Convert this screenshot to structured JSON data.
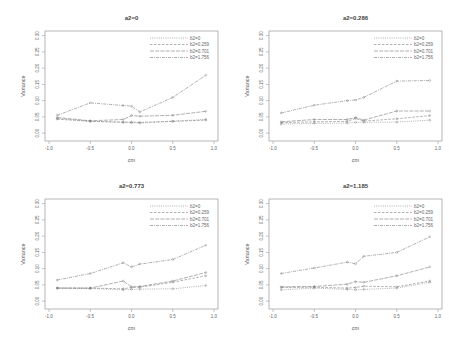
{
  "chart_data": [
    {
      "type": "line",
      "title": "a2=0",
      "xlabel": "cm",
      "ylabel": "Variance",
      "xlim": [
        -1.0,
        1.0
      ],
      "ylim": [
        0.0,
        0.3
      ],
      "xticks": [
        "-1.0",
        "-0.5",
        "0.0",
        "0.5",
        "1.0"
      ],
      "yticks": [
        "0.00",
        "0.05",
        "0.10",
        "0.15",
        "0.20",
        "0.25",
        "0.30"
      ],
      "grid": false,
      "legend_position": "top-right",
      "x": [
        -0.9,
        -0.5,
        -0.1,
        0.0,
        0.1,
        0.5,
        0.9
      ],
      "series": [
        {
          "name": "b2=0",
          "values": [
            0.045,
            0.037,
            0.033,
            0.032,
            0.031,
            0.037,
            0.042
          ]
        },
        {
          "name": "b2=0.259",
          "values": [
            0.043,
            0.036,
            0.034,
            0.034,
            0.033,
            0.036,
            0.04
          ]
        },
        {
          "name": "b2=0.701",
          "values": [
            0.048,
            0.038,
            0.042,
            0.054,
            0.052,
            0.055,
            0.067
          ]
        },
        {
          "name": "b2=1.756",
          "values": [
            0.055,
            0.093,
            0.085,
            0.083,
            0.065,
            0.11,
            0.178
          ]
        }
      ]
    },
    {
      "type": "line",
      "title": "a2=0.286",
      "xlabel": "cm",
      "ylabel": "Variance",
      "xlim": [
        -1.0,
        1.0
      ],
      "ylim": [
        0.0,
        0.3
      ],
      "xticks": [
        "-1.0",
        "-0.5",
        "0.0",
        "0.5",
        "1.0"
      ],
      "yticks": [
        "0.00",
        "0.05",
        "0.10",
        "0.15",
        "0.20",
        "0.25",
        "0.30"
      ],
      "grid": false,
      "legend_position": "top-right",
      "x": [
        -0.9,
        -0.5,
        -0.1,
        0.0,
        0.1,
        0.5,
        0.9
      ],
      "series": [
        {
          "name": "b2=0",
          "values": [
            0.028,
            0.03,
            0.031,
            0.033,
            0.033,
            0.034,
            0.04
          ]
        },
        {
          "name": "b2=0.259",
          "values": [
            0.032,
            0.035,
            0.036,
            0.045,
            0.037,
            0.044,
            0.054
          ]
        },
        {
          "name": "b2=0.701",
          "values": [
            0.035,
            0.042,
            0.042,
            0.048,
            0.04,
            0.068,
            0.068
          ]
        },
        {
          "name": "b2=1.756",
          "values": [
            0.062,
            0.086,
            0.1,
            0.102,
            0.11,
            0.16,
            0.162
          ]
        }
      ]
    },
    {
      "type": "line",
      "title": "a2=0.773",
      "xlabel": "cm",
      "ylabel": "Variance",
      "xlim": [
        -1.0,
        1.0
      ],
      "ylim": [
        0.0,
        0.3
      ],
      "xticks": [
        "-1.0",
        "-0.5",
        "0.0",
        "0.5",
        "1.0"
      ],
      "yticks": [
        "0.00",
        "0.05",
        "0.10",
        "0.15",
        "0.20",
        "0.25",
        "0.30"
      ],
      "grid": false,
      "legend_position": "top-right",
      "x": [
        -0.9,
        -0.5,
        -0.1,
        0.0,
        0.1,
        0.5,
        0.9
      ],
      "series": [
        {
          "name": "b2=0",
          "values": [
            0.04,
            0.039,
            0.035,
            0.036,
            0.037,
            0.038,
            0.048
          ]
        },
        {
          "name": "b2=0.259",
          "values": [
            0.04,
            0.04,
            0.038,
            0.042,
            0.043,
            0.058,
            0.078
          ]
        },
        {
          "name": "b2=0.701",
          "values": [
            0.04,
            0.04,
            0.062,
            0.044,
            0.045,
            0.062,
            0.088
          ]
        },
        {
          "name": "b2=1.756",
          "values": [
            0.065,
            0.085,
            0.118,
            0.105,
            0.114,
            0.128,
            0.172
          ]
        }
      ]
    },
    {
      "type": "line",
      "title": "a2=1.185",
      "xlabel": "cm",
      "ylabel": "Variance",
      "xlim": [
        -1.0,
        1.0
      ],
      "ylim": [
        0.0,
        0.3
      ],
      "xticks": [
        "-1.0",
        "-0.5",
        "0.0",
        "0.5",
        "1.0"
      ],
      "yticks": [
        "0.00",
        "0.05",
        "0.10",
        "0.15",
        "0.20",
        "0.25",
        "0.30"
      ],
      "grid": false,
      "legend_position": "top-right",
      "x": [
        -0.9,
        -0.5,
        -0.1,
        0.0,
        0.1,
        0.5,
        0.9
      ],
      "series": [
        {
          "name": "b2=0",
          "values": [
            0.035,
            0.04,
            0.036,
            0.035,
            0.036,
            0.04,
            0.058
          ]
        },
        {
          "name": "b2=0.259",
          "values": [
            0.042,
            0.043,
            0.04,
            0.042,
            0.046,
            0.044,
            0.062
          ]
        },
        {
          "name": "b2=0.701",
          "values": [
            0.044,
            0.045,
            0.052,
            0.06,
            0.058,
            0.078,
            0.105
          ]
        },
        {
          "name": "b2=1.756",
          "values": [
            0.085,
            0.102,
            0.12,
            0.115,
            0.138,
            0.15,
            0.198
          ]
        }
      ]
    }
  ],
  "style": {
    "line_color": "#7a7a7a",
    "axis_color": "#888888",
    "text_color": "#555555"
  }
}
